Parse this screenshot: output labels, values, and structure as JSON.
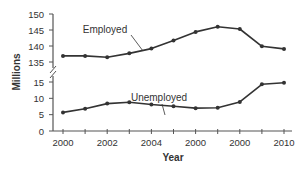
{
  "chart_data": {
    "type": "line",
    "title": "",
    "xlabel": "Year",
    "ylabel": "Millions",
    "x": [
      2000,
      2001,
      2002,
      2003,
      2004,
      2005,
      2006,
      2007,
      2008,
      2009,
      2010
    ],
    "x_tick_labels": [
      "2000",
      "2002",
      "2004",
      "2000",
      "2000",
      "2010"
    ],
    "x_tick_label_positions": [
      0,
      2,
      4,
      6,
      8,
      10
    ],
    "y_upper_ticks": [
      135,
      140,
      145,
      150
    ],
    "y_lower_ticks": [
      0,
      5,
      10,
      15
    ],
    "y_axis_break": true,
    "ylim_upper": [
      135,
      150
    ],
    "ylim_lower": [
      0,
      15
    ],
    "grid": false,
    "legend": "inline annotations",
    "series": [
      {
        "name": "Employed",
        "values": [
          136.9,
          136.9,
          136.5,
          137.7,
          139.2,
          141.7,
          144.4,
          146.0,
          145.3,
          139.9,
          139.1
        ]
      },
      {
        "name": "Unemployed",
        "values": [
          5.7,
          6.8,
          8.4,
          8.8,
          8.1,
          7.6,
          7.0,
          7.1,
          8.9,
          14.3,
          14.8
        ]
      }
    ],
    "annotations": [
      {
        "text": "Employed",
        "points_to_index": 3.5,
        "series": "Employed"
      },
      {
        "text": "Unemployed",
        "points_to_index": 4.8,
        "series": "Unemployed"
      }
    ]
  },
  "colors": {
    "line": "#333333",
    "axis": "#555555",
    "text": "#333333",
    "background": "#ffffff"
  },
  "labels": {
    "ylabel": "Millions",
    "xlabel": "Year",
    "employed": "Employed",
    "unemployed": "Unemployed"
  }
}
